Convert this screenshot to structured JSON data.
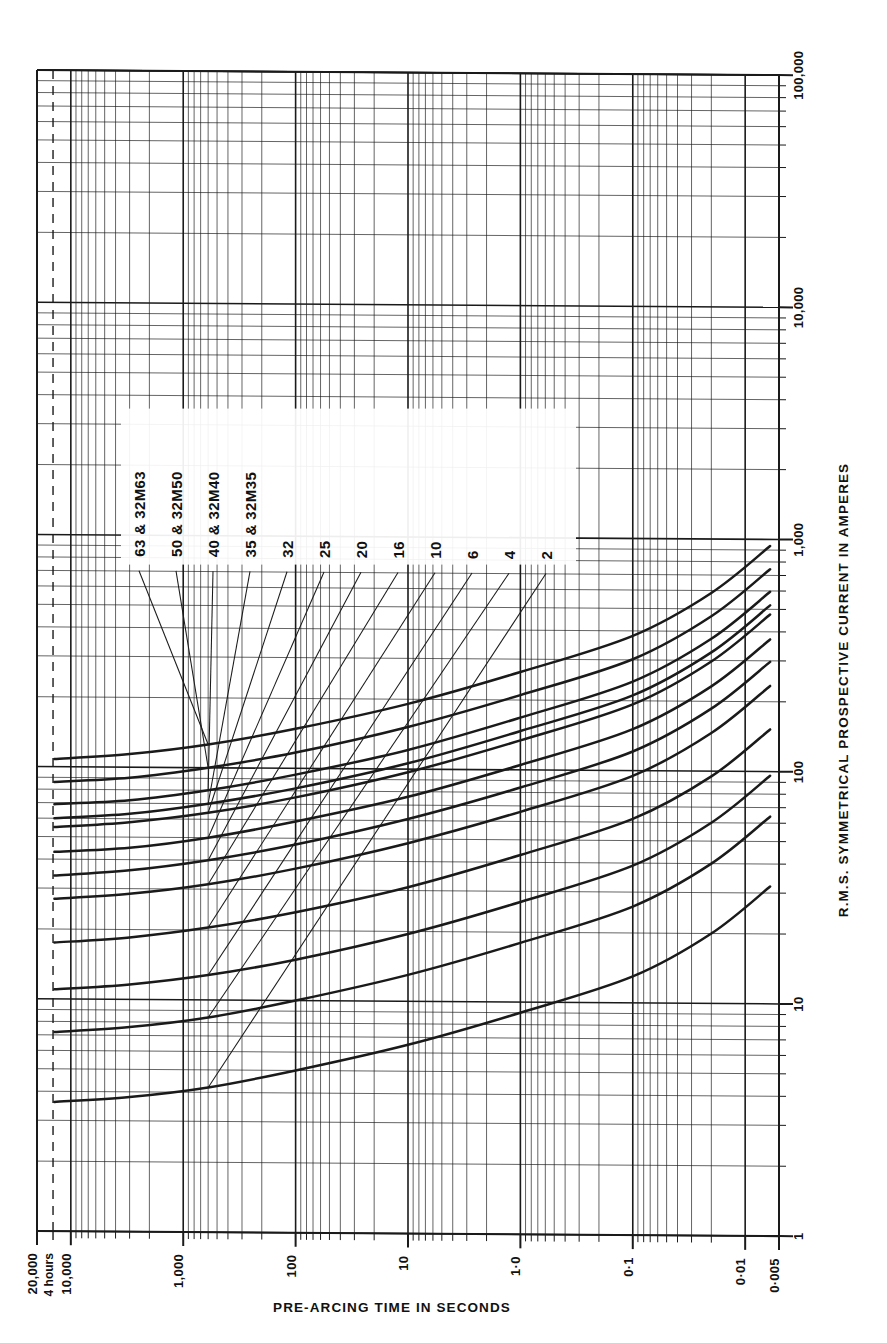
{
  "figure": {
    "kind": "fuse-time-current-characteristic",
    "background": "#ffffff",
    "ink": "#1a1a1a",
    "orientation_note": "chart rendered rotated 90 degrees; current axis runs bottom-to-top on the right margin, time axis runs left-to-right along the bottom margin"
  },
  "axes": {
    "current": {
      "title": "R.M.S. SYMMETRICAL PROSPECTIVE CURRENT IN AMPERES",
      "ticks": [
        "1",
        "10",
        "100",
        "1,000",
        "10,000",
        "100,000"
      ]
    },
    "time": {
      "title": "PRE-ARCING TIME IN SECONDS",
      "ticks": [
        "20,000",
        "10,000",
        "1,000",
        "100",
        "10",
        "1·0",
        "0·1",
        "0·01",
        "0·005"
      ],
      "marker_label": "4 hours"
    }
  },
  "legend": {
    "entries": [
      {
        "label": "63  &  32M63"
      },
      {
        "label": "50  &  32M50"
      },
      {
        "label": "40  &  32M40"
      },
      {
        "label": "35  &  32M35"
      },
      {
        "label": "32"
      },
      {
        "label": "25"
      },
      {
        "label": "20"
      },
      {
        "label": "16"
      },
      {
        "label": "10"
      },
      {
        "label": "6"
      },
      {
        "label": "4"
      },
      {
        "label": "2"
      }
    ]
  },
  "chart_data": {
    "type": "line",
    "xlabel": "R.M.S. SYMMETRICAL PROSPECTIVE CURRENT IN AMPERES",
    "ylabel": "PRE-ARCING TIME IN SECONDS",
    "xscale": "log",
    "yscale": "log",
    "xlim": [
      1,
      100000
    ],
    "ylim": [
      0.005,
      20000
    ],
    "grid": true,
    "legend_position": "inside-upper-left",
    "annotations": [
      {
        "text": "4 hours",
        "axis": "y",
        "value": 14400,
        "style": "dashed"
      }
    ],
    "series": [
      {
        "name": "2",
        "rating_amps": 2,
        "x": [
          3.6,
          3.8,
          4.2,
          5.0,
          6.5,
          9,
          13,
          20,
          32,
          55,
          95
        ],
        "y": [
          14000,
          3000,
          600,
          100,
          10,
          1.0,
          0.1,
          0.02,
          0.006,
          0.0045,
          0.004
        ]
      },
      {
        "name": "4",
        "rating_amps": 4,
        "x": [
          7.2,
          7.6,
          8.4,
          10,
          13,
          18,
          26,
          40,
          64,
          110,
          190
        ],
        "y": [
          14000,
          3000,
          600,
          100,
          10,
          1.0,
          0.1,
          0.02,
          0.006,
          0.0045,
          0.004
        ]
      },
      {
        "name": "6",
        "rating_amps": 6,
        "x": [
          11,
          11.6,
          12.8,
          15,
          19.5,
          27,
          39,
          60,
          96,
          165,
          285
        ],
        "y": [
          14000,
          3000,
          600,
          100,
          10,
          1.0,
          0.1,
          0.02,
          0.006,
          0.0045,
          0.004
        ]
      },
      {
        "name": "10",
        "rating_amps": 10,
        "x": [
          17.5,
          18.5,
          20.5,
          24,
          31,
          43,
          62,
          95,
          152,
          260,
          450
        ],
        "y": [
          14000,
          3000,
          600,
          100,
          10,
          1.0,
          0.1,
          0.02,
          0.006,
          0.0045,
          0.004
        ]
      },
      {
        "name": "16",
        "rating_amps": 16,
        "x": [
          27,
          28.5,
          31.5,
          37,
          48,
          66,
          95,
          146,
          234,
          400,
          690
        ],
        "y": [
          14000,
          3000,
          600,
          100,
          10,
          1.0,
          0.1,
          0.02,
          0.006,
          0.0045,
          0.004
        ]
      },
      {
        "name": "20",
        "rating_amps": 20,
        "x": [
          34,
          36,
          40,
          47,
          61,
          84,
          121,
          186,
          297,
          510,
          880
        ],
        "y": [
          14000,
          3000,
          600,
          100,
          10,
          1.0,
          0.1,
          0.02,
          0.006,
          0.0045,
          0.004
        ]
      },
      {
        "name": "25",
        "rating_amps": 25,
        "x": [
          43,
          45,
          50,
          59,
          76,
          105,
          151,
          232,
          371,
          635,
          1100
        ],
        "y": [
          14000,
          3000,
          600,
          100,
          10,
          1.0,
          0.1,
          0.02,
          0.006,
          0.0045,
          0.004
        ]
      },
      {
        "name": "32",
        "rating_amps": 32,
        "x": [
          55,
          58,
          64,
          75,
          97,
          134,
          193,
          297,
          475,
          815,
          1400
        ],
        "y": [
          14000,
          3000,
          600,
          100,
          10,
          1.0,
          0.1,
          0.02,
          0.006,
          0.0045,
          0.004
        ]
      },
      {
        "name": "35  &  32M35",
        "rating_amps": 35,
        "x": [
          60,
          63,
          70,
          82,
          106,
          147,
          211,
          325,
          520,
          890,
          1530
        ],
        "y": [
          14000,
          3000,
          600,
          100,
          10,
          1.0,
          0.1,
          0.02,
          0.006,
          0.0045,
          0.004
        ]
      },
      {
        "name": "40  &  32M40",
        "rating_amps": 40,
        "x": [
          69,
          72,
          80,
          94,
          121,
          168,
          242,
          372,
          595,
          1020,
          1750
        ],
        "y": [
          14000,
          3000,
          600,
          100,
          10,
          1.0,
          0.1,
          0.02,
          0.006,
          0.0045,
          0.004
        ]
      },
      {
        "name": "50  &  32M50",
        "rating_amps": 50,
        "x": [
          86,
          90,
          100,
          117,
          152,
          210,
          302,
          465,
          744,
          1275,
          2200
        ],
        "y": [
          14000,
          3000,
          600,
          100,
          10,
          1.0,
          0.1,
          0.02,
          0.006,
          0.0045,
          0.004
        ]
      },
      {
        "name": "63  &  32M63",
        "rating_amps": 63,
        "x": [
          108,
          114,
          126,
          148,
          191,
          264,
          381,
          586,
          937,
          1605,
          2770
        ],
        "y": [
          14000,
          3000,
          600,
          100,
          10,
          1.0,
          0.1,
          0.02,
          0.006,
          0.0045,
          0.004
        ]
      }
    ]
  }
}
